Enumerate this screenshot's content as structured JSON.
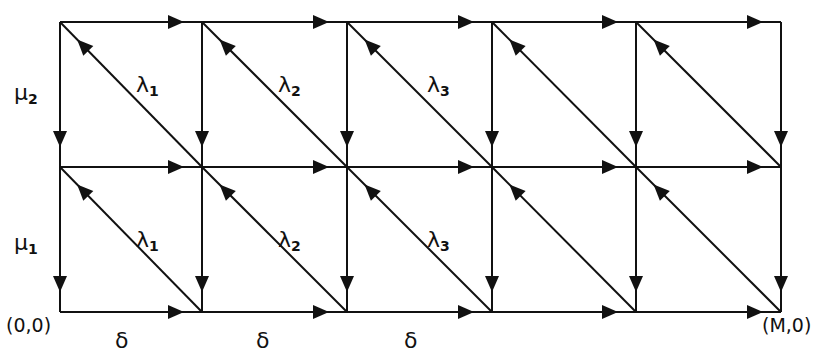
{
  "diagram": {
    "type": "lattice-transition-diagram",
    "columns_x": [
      60,
      202,
      347,
      492,
      636,
      781
    ],
    "rows_y": [
      22,
      167,
      312
    ],
    "colors": {
      "stroke": "#111111",
      "background": "#ffffff"
    },
    "labels": {
      "mu2": {
        "symbol": "μ",
        "sub": "2"
      },
      "mu1": {
        "symbol": "μ",
        "sub": "1"
      },
      "lambda_top": [
        {
          "symbol": "λ",
          "sub": "1"
        },
        {
          "symbol": "λ",
          "sub": "2"
        },
        {
          "symbol": "λ",
          "sub": "3"
        }
      ],
      "lambda_bottom": [
        {
          "symbol": "λ",
          "sub": "1"
        },
        {
          "symbol": "λ",
          "sub": "2"
        },
        {
          "symbol": "λ",
          "sub": "3"
        }
      ],
      "delta": [
        "δ",
        "δ",
        "δ"
      ],
      "origin": "(0,0)",
      "end": "(M,0)"
    },
    "edge_rules": {
      "horizontal": "arrow pointing right near right end",
      "vertical": "arrow pointing down near lower end",
      "diagonal": "from top-left to bottom-right of each cell, arrow pointing up-left near top-left"
    }
  }
}
